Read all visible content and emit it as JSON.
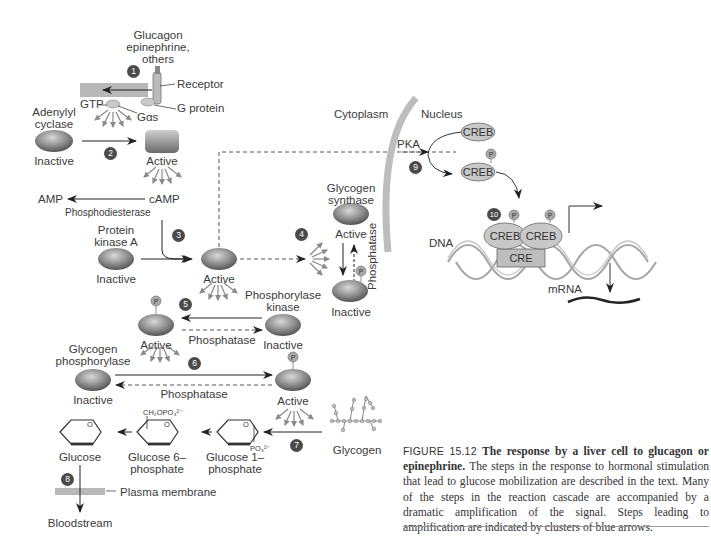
{
  "figure": {
    "caption_label": "FIGURE 15.12",
    "caption_title": "The response by a liver cell to glucagon or epinephrine.",
    "caption_body": "The steps in the response to hormonal stimulation that lead to glucose mobilization are described in the text. Many of the steps in the reaction cascade are accompanied by a dramatic amplification of the signal. Steps leading to amplification are indicated by clusters of blue arrows."
  },
  "labels": {
    "hormone": "Glucagon",
    "hormone2": "epinephrine,",
    "hormone3": "others",
    "receptor": "Receptor",
    "g_protein": "G protein",
    "gtp": "GTP",
    "g_alpha_s": "Gαs",
    "adenylyl1": "Adenylyl",
    "adenylyl2": "cyclase",
    "inactive": "Inactive",
    "active": "Active",
    "amp": "AMP",
    "camp": "cAMP",
    "phosphodiesterase": "Phosphodiesterase",
    "pka1": "Protein",
    "pka2": "kinase A",
    "gs1": "Glycogen",
    "gs2": "synthase",
    "phosphatase": "Phosphatase",
    "phk1": "Phosphorylase",
    "phk2": "kinase",
    "gp1": "Glycogen",
    "gp2": "phosphorylase",
    "glucose": "Glucose",
    "g6p1": "Glucose 6–",
    "g6p2": "phosphate",
    "g1p1": "Glucose 1–",
    "g1p2": "phosphate",
    "glycogen": "Glycogen",
    "plasma_membrane": "Plasma membrane",
    "bloodstream": "Bloodstream",
    "ch2opo3": "CH₂OPO₃²⁻",
    "po3": "PO₃²⁻",
    "ring_o": "O",
    "cytoplasm": "Cytoplasm",
    "nucleus": "Nucleus",
    "pka": "PKA",
    "creb": "CREB",
    "cre": "CRE",
    "dna": "DNA",
    "mrna": "mRNA",
    "p": "P"
  },
  "steps": [
    "1",
    "2",
    "3",
    "4",
    "5",
    "6",
    "7",
    "8",
    "9",
    "10"
  ],
  "colors": {
    "membrane": "#b8b8b8",
    "enzyme_dark": "#555555",
    "enzyme_light": "#b0b0b0",
    "step_badge": "#4a4a4a",
    "amplification_arrows": "#8a8a8a",
    "nuclear_envelope": "#bdbdbd"
  }
}
